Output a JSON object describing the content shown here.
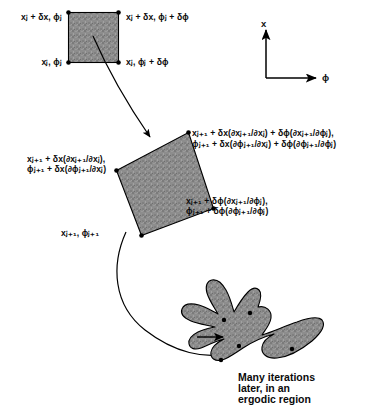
{
  "figure": {
    "type": "phase-space-tangent-map-diagram",
    "background_color": "#ffffff",
    "shape_fill_color": "#8a8a8a",
    "stroke_color": "#000000"
  },
  "axes": {
    "vertical_label": "x",
    "horizontal_label": "ϕ",
    "vertical_direction": "up",
    "horizontal_direction": "right"
  },
  "square_labels": {
    "top_left": "xⱼ + δx, ϕⱼ",
    "top_right": "xⱼ + δx, ϕⱼ + δϕ",
    "bottom_left": "xⱼ, ϕⱼ",
    "bottom_right": "xⱼ, ϕⱼ + δϕ"
  },
  "parallelogram_labels": {
    "left_line1": "xⱼ₊₁ + δx(∂xⱼ₊₁/∂xⱼ),",
    "left_line2": "ϕⱼ₊₁ + δx(∂ϕⱼ₊₁/∂xⱼ)",
    "top_right_line1": "xⱼ₊₁ + δx(∂xⱼ₊₁/∂xⱼ) + δϕ(∂xⱼ₊₁/∂ϕⱼ),",
    "top_right_line2": "ϕⱼ₊₁ + δx(∂ϕⱼ₊₁/∂xⱼ) + δϕ(∂ϕⱼ₊₁/∂ϕⱼ)",
    "bottom_right_line1": "xⱼ₊₁ + δϕ(∂xⱼ₊₁/∂ϕⱼ),",
    "bottom_right_line2": "ϕⱼ₊₁ + δϕ(∂ϕⱼ₊₁/∂ϕⱼ)",
    "bottom_left": "xⱼ₊₁, ϕⱼ₊₁"
  },
  "blob_caption": {
    "line1": "Many iterations",
    "line2": "later, in an",
    "line3": "ergodic region"
  }
}
